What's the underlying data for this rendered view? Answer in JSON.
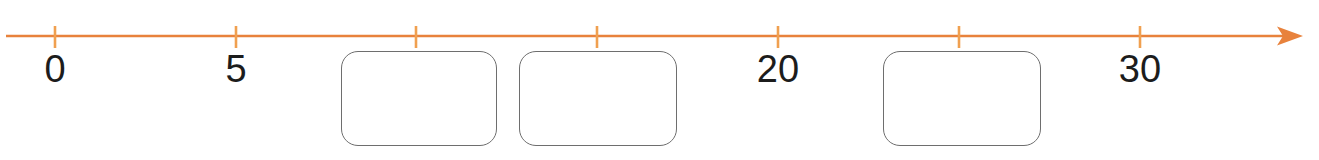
{
  "figure": {
    "kind": "number-line-with-blanks",
    "axis_color": "#e8823c",
    "tick_color": "#f0a050",
    "label_color": "#1c1c1c",
    "box_border_color": "#6e6e6e",
    "box_fill_color": "#ffffff",
    "arrow_direction": "right"
  },
  "axis": {
    "name": "number-line",
    "y": 36,
    "x_start": 6,
    "x_end": 1303,
    "tick_top": 26,
    "tick_bottom": 48
  },
  "ticks": [
    {
      "value": 0,
      "x": 55,
      "label": "0",
      "label_shown": true
    },
    {
      "value": 5,
      "x": 236,
      "label": "5",
      "label_shown": true
    },
    {
      "value": 10,
      "x": 416,
      "label": "",
      "label_shown": false
    },
    {
      "value": 15,
      "x": 597,
      "label": "",
      "label_shown": false
    },
    {
      "value": 20,
      "x": 778,
      "label": "20",
      "label_shown": true
    },
    {
      "value": 25,
      "x": 959,
      "label": "",
      "label_shown": false
    },
    {
      "value": 30,
      "x": 1140,
      "label": "30",
      "label_shown": true
    }
  ],
  "answer_boxes": [
    {
      "id": "box-1",
      "value": "",
      "x": 341,
      "y": 51,
      "width": 156,
      "height": 95,
      "under_tick_value": 10
    },
    {
      "id": "box-2",
      "value": "",
      "x": 519,
      "y": 51,
      "width": 158,
      "height": 95,
      "under_tick_value": 15
    },
    {
      "id": "box-3",
      "value": "",
      "x": 883,
      "y": 51,
      "width": 158,
      "height": 95,
      "under_tick_value": 25
    }
  ],
  "labels": {
    "tick_label_y": 50
  }
}
